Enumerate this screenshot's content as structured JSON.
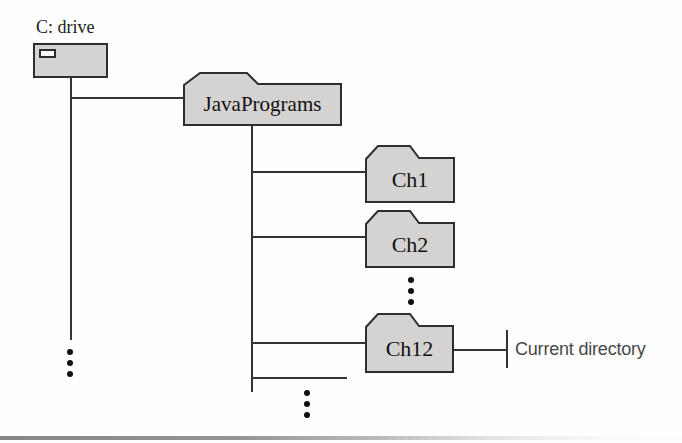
{
  "diagram": {
    "drive": {
      "label": "C: drive"
    },
    "root_folder": {
      "label": "JavaPrograms"
    },
    "subfolders": [
      {
        "label": "Ch1"
      },
      {
        "label": "Ch2"
      },
      {
        "label": "Ch12"
      }
    ],
    "callout": {
      "label": "Current directory"
    },
    "colors": {
      "folder_fill": "#d5d3d1",
      "outline": "#2e2e2e",
      "line": "#333333",
      "callout_text": "#474747"
    },
    "icons": {
      "drive": "disk-drive-box-icon",
      "ellipsis": "vertical-ellipsis-icon"
    }
  }
}
